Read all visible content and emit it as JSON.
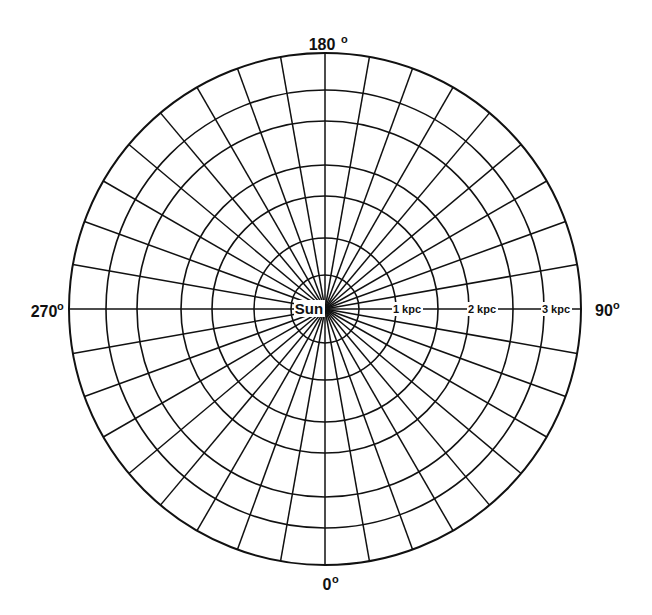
{
  "diagram": {
    "type": "polar-grid",
    "center_label": "Sun",
    "center": {
      "x": 325,
      "y": 309
    },
    "circle_radii_px": [
      34,
      71,
      113,
      144,
      188,
      219,
      256
    ],
    "spoke_spacing_deg": 10,
    "spoke_count": 36,
    "line_color": "#111111",
    "background": "#ffffff",
    "angle_labels": [
      {
        "text": "180",
        "deg_symbol": "o",
        "position": "top"
      },
      {
        "text": "0",
        "deg_symbol": "o",
        "position": "bottom"
      },
      {
        "text": "270",
        "deg_symbol": "o",
        "position": "left"
      },
      {
        "text": "90",
        "deg_symbol": "o",
        "position": "right"
      }
    ],
    "distance_labels": [
      {
        "text": "1 kpc",
        "x": 407
      },
      {
        "text": "2 kpc",
        "x": 482
      },
      {
        "text": "3 kpc",
        "x": 556
      }
    ]
  }
}
